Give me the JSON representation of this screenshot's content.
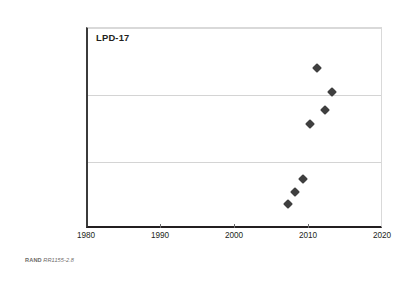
{
  "figure": {
    "series_label": "LPD-17",
    "footnote_source": "RAND",
    "footnote_id": "RR1155-2.8"
  },
  "chart_data": {
    "type": "scatter",
    "title": "LPD-17",
    "xlabel": "",
    "ylabel": "",
    "xlim": [
      1980,
      2020
    ],
    "ylim": [
      0,
      30000000
    ],
    "grid": true,
    "legend_position": "none",
    "marker_style": "diamond",
    "marker_color": "#3f3f3f",
    "x_ticks": [
      1980,
      1990,
      2000,
      2010,
      2020
    ],
    "x_tick_labels": [
      "1980",
      "1990",
      "2000",
      "2010",
      "2020"
    ],
    "y_ticks": [
      0,
      10000000,
      20000000,
      30000000
    ],
    "y_tick_labels": [
      "0",
      "$10,000,000",
      "$20,000,000",
      "$30,000,000"
    ],
    "series": [
      {
        "name": "LPD-17",
        "points": [
          {
            "x": 2007,
            "y": 3800000
          },
          {
            "x": 2008,
            "y": 5500000
          },
          {
            "x": 2009,
            "y": 7500000
          },
          {
            "x": 2010,
            "y": 15600000
          },
          {
            "x": 2011,
            "y": 24000000
          },
          {
            "x": 2012,
            "y": 17800000
          },
          {
            "x": 2013,
            "y": 20400000
          }
        ]
      }
    ]
  }
}
